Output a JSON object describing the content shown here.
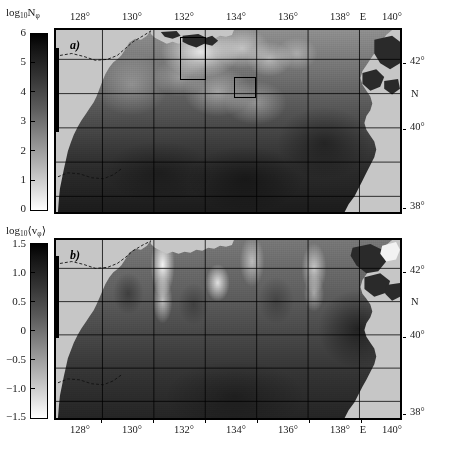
{
  "figure": {
    "type": "two-panel-geographic-heatmap",
    "region": "Sea of Japan / East Sea",
    "panels": [
      {
        "id": "a",
        "label": "a)",
        "colorbar": {
          "title_html": "log<sub>10</sub>N<sub>φ</sub>",
          "title_plain": "log10 N_phi",
          "min": 0,
          "max": 6,
          "ticks": [
            "6",
            "5",
            "4",
            "3",
            "2",
            "1",
            "0"
          ],
          "tick_values": [
            6,
            5,
            4,
            3,
            2,
            1,
            0
          ],
          "orientation": "vertical",
          "scale": "grayscale-black-high-white-low"
        },
        "annotation_boxes": 2
      },
      {
        "id": "b",
        "label": "b)",
        "colorbar": {
          "title_html": "log<sub>10</sub>⟨v<sub>φ</sub>⟩",
          "title_plain": "log10 <v_phi>",
          "min": -1.5,
          "max": 1.5,
          "ticks": [
            "1.5",
            "1.0",
            "0.5",
            "0",
            "−0.5",
            "−1.0",
            "−1.5"
          ],
          "tick_values": [
            1.5,
            1.0,
            0.5,
            0,
            -0.5,
            -1.0,
            -1.5
          ],
          "orientation": "vertical",
          "scale": "grayscale-black-high-white-low"
        },
        "annotation_boxes": 0
      }
    ],
    "axes": {
      "longitude": {
        "labels": [
          "128°",
          "130°",
          "132°",
          "134°",
          "136°",
          "138°",
          "E",
          "140°"
        ],
        "values": [
          128,
          130,
          132,
          134,
          136,
          138,
          null,
          140
        ],
        "hemisphere": "E",
        "range": [
          126.6,
          141.4
        ],
        "shown_on": [
          "top",
          "bottom"
        ]
      },
      "latitude": {
        "labels": [
          "42°",
          "N",
          "40°",
          "38°"
        ],
        "values": [
          42,
          null,
          40,
          38
        ],
        "hemisphere": "N",
        "range": [
          37.6,
          42.9
        ],
        "shown_on": [
          "right"
        ]
      }
    },
    "colors": {
      "land": "#c6c6c6",
      "land_dark": "#2a2a2a",
      "frame": "#000000",
      "graticule": "#000000",
      "background": "#ffffff"
    }
  }
}
